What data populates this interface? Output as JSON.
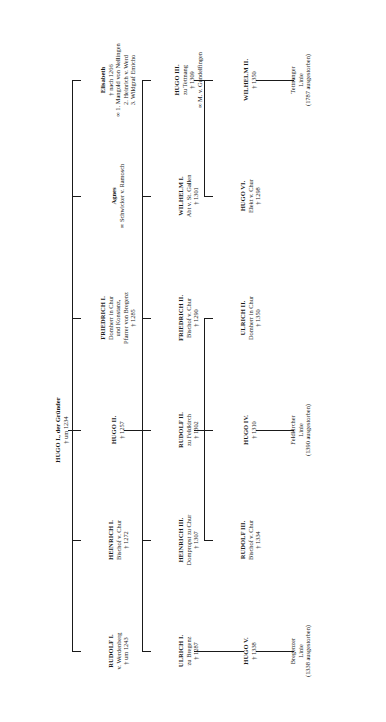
{
  "diagram": {
    "orientation": "rotated-90-ccw",
    "ink_color": "#1a1a1a",
    "paper_color": "#ffffff",
    "marriage_symbol": "∞",
    "death_symbol": "†"
  },
  "root": {
    "name": "HUGO I., der Gründer",
    "death": "† um 1234"
  },
  "generation1": [
    {
      "id": "rudolf-1",
      "name": "RUDOLF I.",
      "lines": [
        "v. Werdenberg",
        "† um 1243"
      ]
    },
    {
      "id": "heinrich-1",
      "name": "HEINRICH I.",
      "lines": [
        "Bischof v. Chur",
        "† 1272"
      ]
    },
    {
      "id": "hugo-2",
      "name": "HUGO II.",
      "lines": [
        "† 1257"
      ]
    },
    {
      "id": "friedrich-1",
      "name": "FRIEDRICH I.",
      "lines": [
        "Domherr in Chur",
        "und Konstanz,",
        "Pfarrer von Bregenz",
        "† 1285"
      ]
    },
    {
      "id": "agnes",
      "name": "Agnes",
      "lines": [
        "∞ Schwicker v. Ramosch"
      ]
    },
    {
      "id": "elisabeth",
      "name": "Elisabeth",
      "lines": [
        "† nach 1266",
        "∞ 1. Mangold von Nellingen",
        "2. Heinrich v. Werd",
        "3. Wildgraf Emicho"
      ]
    }
  ],
  "generation2": [
    {
      "id": "ulrich-1",
      "name": "ULRICH I.",
      "lines": [
        "zu Bregenz",
        "† 1287"
      ]
    },
    {
      "id": "heinrich-3",
      "name": "HEINRICH III.",
      "lines": [
        "Dompropst zu Chur",
        "† 1307"
      ]
    },
    {
      "id": "rudolf-2",
      "name": "RUDOLF II.",
      "lines": [
        "zu Feldkirch",
        "† 1302"
      ]
    },
    {
      "id": "friedrich-2",
      "name": "FRIEDRICH II.",
      "lines": [
        "Bischof v. Chur",
        "† 1290"
      ]
    },
    {
      "id": "wilhelm-1",
      "name": "WILHELM I.",
      "lines": [
        "Abt v. St. Gallen",
        "† 1301"
      ]
    },
    {
      "id": "hugo-3",
      "name": "HUGO III.",
      "lines": [
        "zu Tettnang",
        "† 1309",
        "∞ M. v. Gundelfingen"
      ]
    }
  ],
  "generation3": [
    {
      "id": "hugo-5",
      "name": "HUGO V.",
      "lines": [
        "† 1338"
      ]
    },
    {
      "id": "rudolf-3",
      "name": "RUDOLF III.",
      "lines": [
        "Bischof v. Chur",
        "† 1334"
      ]
    },
    {
      "id": "hugo-4",
      "name": "HUGO IV.",
      "lines": [
        "† 1310"
      ]
    },
    {
      "id": "ulrich-2",
      "name": "ULRICH II.",
      "lines": [
        "Domherr in Chur",
        "† 1350"
      ]
    },
    {
      "id": "hugo-6",
      "name": "HUGO VI.",
      "lines": [
        "Elekt v. Chur",
        "† 1298"
      ]
    },
    {
      "id": "wilhelm-2",
      "name": "WILHELM II.",
      "lines": [
        "† 1350"
      ]
    }
  ],
  "lineages": [
    {
      "id": "bregenzer-linie",
      "lines": [
        "Bregenzer",
        "Linie",
        "(1338 ausgestorben)"
      ]
    },
    {
      "id": "feldkircher-linie",
      "lines": [
        "Feldkircher",
        "Linie",
        "(1390 ausgestorben)"
      ]
    },
    {
      "id": "tettnanger-linie",
      "lines": [
        "Tettnanger",
        "Linie",
        "(1787 ausgestorben)"
      ]
    }
  ]
}
